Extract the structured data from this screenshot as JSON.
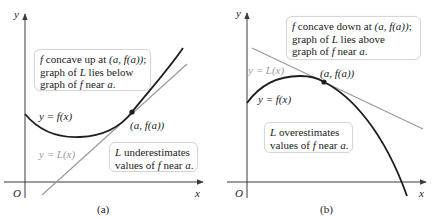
{
  "colors": {
    "curve": "#1e1e1e",
    "tangent": "#9a9a9a",
    "axis": "#3a3a3a",
    "callout_border": "#d6d6d6"
  },
  "panels": [
    {
      "id": "a",
      "caption": "(a)",
      "axis": {
        "y_label": "y",
        "x_label": "x",
        "origin_label": "O"
      },
      "curve_label": "y = f(x)",
      "tangent_label": "y = L(x)",
      "point_label": "(a, f(a))",
      "callout_top": {
        "line1_f": "f",
        "line1_rest": " concave up at ",
        "line1_math": "(a, f(a))",
        "line1_end": ";",
        "line2_pre": "graph of ",
        "line2_L": "L",
        "line2_rest": " lies below",
        "line3_pre": "graph of ",
        "line3_f": "f",
        "line3_rest": " near ",
        "line3_a": "a",
        "line3_end": "."
      },
      "callout_bottom": {
        "line1_L": "L",
        "line1_rest": " underestimates",
        "line2_pre": "values of ",
        "line2_f": "f",
        "line2_rest": " near ",
        "line2_a": "a",
        "line2_end": "."
      },
      "concavity": "up",
      "relation": "L lies below f"
    },
    {
      "id": "b",
      "caption": "(b)",
      "axis": {
        "y_label": "y",
        "x_label": "x",
        "origin_label": "O"
      },
      "curve_label": "y = f(x)",
      "tangent_label": "y = L(x)",
      "point_label": "(a, f(a))",
      "callout_top": {
        "line1_f": "f",
        "line1_rest": " concave down at ",
        "line1_math": "(a, f(a))",
        "line1_end": ";",
        "line2_pre": "graph of ",
        "line2_L": "L",
        "line2_rest": " lies above",
        "line3_pre": "graph of ",
        "line3_f": "f",
        "line3_rest": " near ",
        "line3_a": "a",
        "line3_end": "."
      },
      "callout_bottom": {
        "line1_L": "L",
        "line1_rest": " overestimates",
        "line2_pre": "values of ",
        "line2_f": "f",
        "line2_rest": " near ",
        "line2_a": "a",
        "line2_end": "."
      },
      "concavity": "down",
      "relation": "L lies above f"
    }
  ]
}
